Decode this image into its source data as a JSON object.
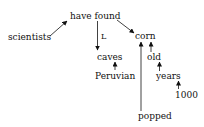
{
  "diagram": {
    "type": "dependency-tree",
    "nodes": [
      {
        "id": "have_found",
        "text": "have found",
        "x": 70,
        "y": 11
      },
      {
        "id": "scientists",
        "text": "scientists",
        "x": 8,
        "y": 32
      },
      {
        "id": "corn",
        "text": "corn",
        "x": 135,
        "y": 31
      },
      {
        "id": "caves",
        "text": "caves",
        "x": 97,
        "y": 52
      },
      {
        "id": "peruvian",
        "text": "Peruvian",
        "x": 95,
        "y": 71
      },
      {
        "id": "old",
        "text": "old",
        "x": 147,
        "y": 52
      },
      {
        "id": "years",
        "text": "years",
        "x": 156,
        "y": 71
      },
      {
        "id": "n1000",
        "text": "1000",
        "x": 175,
        "y": 90
      },
      {
        "id": "popped",
        "text": "popped",
        "x": 138,
        "y": 111
      }
    ],
    "edge_labels": [
      {
        "text": "L",
        "x": 101,
        "y": 32
      }
    ],
    "edges": [
      {
        "from": "scientists",
        "to": "have_found"
      },
      {
        "from": "have_found",
        "to": "caves",
        "label": "L"
      },
      {
        "from": "have_found",
        "to": "corn"
      },
      {
        "from": "peruvian",
        "to": "caves"
      },
      {
        "from": "old",
        "to": "corn"
      },
      {
        "from": "years",
        "to": "old"
      },
      {
        "from": "n1000",
        "to": "years"
      },
      {
        "from": "popped",
        "to": "corn"
      }
    ]
  }
}
